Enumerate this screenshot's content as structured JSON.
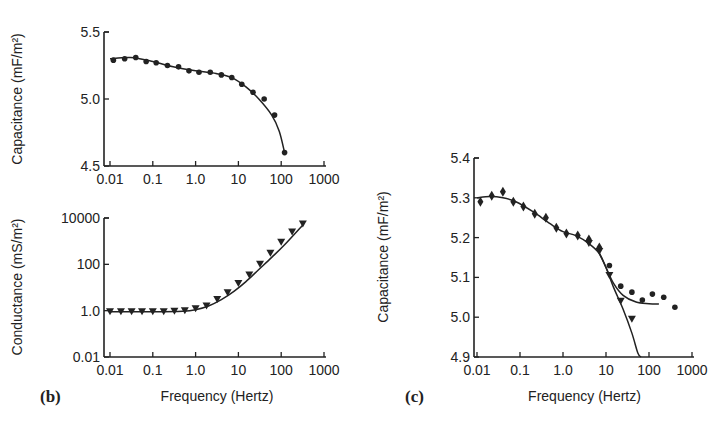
{
  "chart_data": [
    {
      "id": "top",
      "type": "scatter",
      "panel_label": "",
      "title": "",
      "xlabel": "",
      "ylabel": "Capacitance (mF/m²)",
      "xscale": "log",
      "xlim": [
        0.01,
        1000
      ],
      "ylim": [
        4.5,
        5.5
      ],
      "xticks": [
        "0.01",
        "0.1",
        "1.0",
        "10",
        "100",
        "1000"
      ],
      "yticks": [
        "4.5",
        "5.0",
        "5.5"
      ],
      "grid": false,
      "series": [
        {
          "name": "measured",
          "marker": "circle",
          "x": [
            0.012,
            0.022,
            0.04,
            0.07,
            0.12,
            0.22,
            0.4,
            0.7,
            1.2,
            2.2,
            4,
            7,
            12,
            22,
            40,
            70,
            120
          ],
          "y": [
            5.29,
            5.3,
            5.31,
            5.28,
            5.27,
            5.25,
            5.24,
            5.21,
            5.2,
            5.2,
            5.18,
            5.16,
            5.11,
            5.05,
            5.0,
            4.88,
            4.6
          ]
        },
        {
          "name": "fit",
          "marker": "line",
          "x": [
            0.01,
            0.03,
            0.1,
            0.3,
            1,
            3,
            7,
            15,
            30,
            60,
            90,
            120
          ],
          "y": [
            5.3,
            5.31,
            5.28,
            5.24,
            5.21,
            5.19,
            5.16,
            5.09,
            5.0,
            4.88,
            4.76,
            4.6
          ]
        }
      ]
    },
    {
      "id": "b",
      "type": "scatter",
      "panel_label": "(b)",
      "title": "",
      "xlabel": "Frequency (Hertz)",
      "ylabel": "Conductance (mS/m²)",
      "xscale": "log",
      "yscale": "log",
      "xlim": [
        0.01,
        1000
      ],
      "ylim": [
        0.01,
        10000
      ],
      "xticks": [
        "0.01",
        "0.1",
        "1.0",
        "10",
        "100",
        "1000"
      ],
      "yticks": [
        "0.01",
        "1.0",
        "100",
        "10000"
      ],
      "grid": false,
      "series": [
        {
          "name": "measured",
          "marker": "triangle-down",
          "x": [
            0.01,
            0.018,
            0.032,
            0.056,
            0.1,
            0.18,
            0.32,
            0.56,
            1.0,
            1.8,
            3.2,
            5.6,
            10,
            18,
            32,
            56,
            100,
            180,
            320
          ],
          "y": [
            0.9,
            0.9,
            0.9,
            0.9,
            0.9,
            0.9,
            0.95,
            1.0,
            1.2,
            1.6,
            3,
            6,
            15,
            35,
            100,
            300,
            900,
            2500,
            5500
          ]
        },
        {
          "name": "fit",
          "marker": "line",
          "x": [
            0.01,
            0.1,
            0.5,
            1,
            2,
            4,
            8,
            15,
            30,
            60,
            120,
            320
          ],
          "y": [
            0.9,
            0.9,
            0.95,
            1.1,
            1.6,
            3,
            7,
            18,
            60,
            200,
            700,
            5000
          ]
        }
      ]
    },
    {
      "id": "c",
      "type": "scatter",
      "panel_label": "(c)",
      "title": "",
      "xlabel": "Frequency (Hertz)",
      "ylabel": "Capacitance (mF/m²)",
      "xscale": "log",
      "xlim": [
        0.01,
        1000
      ],
      "ylim": [
        4.9,
        5.4
      ],
      "xticks": [
        "0.01",
        "0.1",
        "1.0",
        "10",
        "100",
        "1000"
      ],
      "yticks": [
        "4.9",
        "5.0",
        "5.1",
        "5.2",
        "5.3",
        "5.4"
      ],
      "grid": false,
      "series": [
        {
          "name": "measured-diamond",
          "marker": "diamond",
          "x": [
            0.012,
            0.022,
            0.04,
            0.07,
            0.12,
            0.22,
            0.4,
            0.7,
            1.2,
            2.2,
            4,
            7
          ],
          "y": [
            5.29,
            5.305,
            5.315,
            5.29,
            5.278,
            5.26,
            5.25,
            5.225,
            5.21,
            5.205,
            5.195,
            5.175
          ]
        },
        {
          "name": "measured-circle",
          "marker": "circle",
          "x": [
            12,
            22,
            40,
            70,
            120,
            220,
            400
          ],
          "y": [
            5.13,
            5.078,
            5.063,
            5.043,
            5.058,
            5.05,
            5.025
          ]
        },
        {
          "name": "measured-triangle",
          "marker": "triangle-down",
          "x": [
            4,
            7,
            12,
            22,
            40
          ],
          "y": [
            5.185,
            5.165,
            5.105,
            5.04,
            4.995
          ]
        },
        {
          "name": "fit-plateau",
          "marker": "line",
          "x": [
            0.01,
            0.02,
            0.04,
            0.08,
            0.2,
            0.5,
            1,
            2,
            4,
            7,
            10,
            15,
            25,
            50,
            100,
            170
          ],
          "y": [
            5.3,
            5.303,
            5.3,
            5.29,
            5.265,
            5.235,
            5.215,
            5.205,
            5.185,
            5.16,
            5.125,
            5.085,
            5.055,
            5.038,
            5.034,
            5.033
          ]
        },
        {
          "name": "fit-drop",
          "marker": "line",
          "x": [
            7,
            10,
            15,
            25,
            40,
            55,
            65
          ],
          "y": [
            5.16,
            5.125,
            5.075,
            5.02,
            4.96,
            4.91,
            4.9
          ]
        }
      ]
    }
  ]
}
